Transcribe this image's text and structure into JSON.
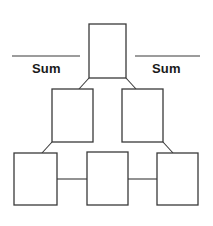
{
  "diagram": {
    "type": "sum-pyramid-puzzle",
    "title": "",
    "background_color": "#ffffff",
    "line_color": "#3a3a3a",
    "box_fill_color": "#ffffff",
    "text_color": "#1a1a1a",
    "labels": {
      "left_sum": "Sum",
      "right_sum": "Sum"
    },
    "rules": [
      {
        "name": "left-sum-rule",
        "x1": 12,
        "y1": 56,
        "x2": 80,
        "y2": 56
      },
      {
        "name": "right-sum-rule",
        "x1": 135,
        "y1": 56,
        "x2": 200,
        "y2": 56
      }
    ],
    "rows": [
      {
        "row": 1,
        "boxes": [
          {
            "name": "box-top",
            "value": "",
            "x": 89,
            "y": 24,
            "width": 37,
            "height": 54
          }
        ]
      },
      {
        "row": 2,
        "boxes": [
          {
            "name": "box-middle-left",
            "value": "",
            "x": 52,
            "y": 89,
            "width": 41,
            "height": 53
          },
          {
            "name": "box-middle-right",
            "value": "",
            "x": 122,
            "y": 89,
            "width": 41,
            "height": 53
          }
        ]
      },
      {
        "row": 3,
        "boxes": [
          {
            "name": "box-bottom-left",
            "value": "",
            "x": 14,
            "y": 153,
            "width": 43,
            "height": 52
          },
          {
            "name": "box-bottom-center",
            "value": "",
            "x": 87,
            "y": 152,
            "width": 41,
            "height": 53
          },
          {
            "name": "box-bottom-right",
            "value": "",
            "x": 157,
            "y": 153,
            "width": 41,
            "height": 52
          }
        ]
      }
    ],
    "connectors": [
      {
        "name": "connector-top-to-middle-left",
        "kind": "diagonal",
        "x1": 89,
        "y1": 78,
        "x2": 79,
        "y2": 89
      },
      {
        "name": "connector-top-to-middle-right",
        "kind": "diagonal",
        "x1": 126,
        "y1": 78,
        "x2": 136,
        "y2": 89
      },
      {
        "name": "connector-middle-left-to-bottom-left",
        "kind": "diagonal",
        "x1": 52,
        "y1": 142,
        "x2": 42,
        "y2": 153
      },
      {
        "name": "connector-middle-right-to-bottom-right",
        "kind": "diagonal",
        "x1": 163,
        "y1": 142,
        "x2": 173,
        "y2": 153
      },
      {
        "name": "connector-bottom-left-to-bottom-center",
        "kind": "horizontal",
        "x1": 57,
        "y1": 179,
        "x2": 87,
        "y2": 179
      },
      {
        "name": "connector-bottom-center-to-bottom-right",
        "kind": "horizontal",
        "x1": 128,
        "y1": 179,
        "x2": 157,
        "y2": 179
      }
    ]
  }
}
